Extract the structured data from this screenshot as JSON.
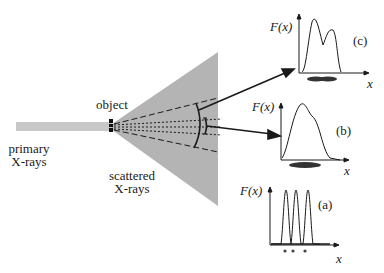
{
  "labels": {
    "primary_line1": "primary",
    "primary_line2": "X-rays",
    "object": "object",
    "scattered_line1": "scattered",
    "scattered_line2": "X-rays",
    "fx_c": "F(x)",
    "fx_b": "F(x)",
    "fx_a": "F(x)",
    "panel_c": "(c)",
    "panel_b": "(b)",
    "panel_a": "(a)",
    "x_c": "x",
    "x_b": "x",
    "x_a": "x"
  },
  "colors": {
    "beam": "#c8c8c8",
    "cone": "#b4b4b4",
    "ink": "#1a1a1a"
  },
  "panels": [
    {
      "id": "c",
      "description": "two overlapping peaks from merged/elongated object"
    },
    {
      "id": "b",
      "description": "single broad asymmetric peak from merged object"
    },
    {
      "id": "a",
      "description": "three sharp separated peaks from three point objects"
    }
  ]
}
